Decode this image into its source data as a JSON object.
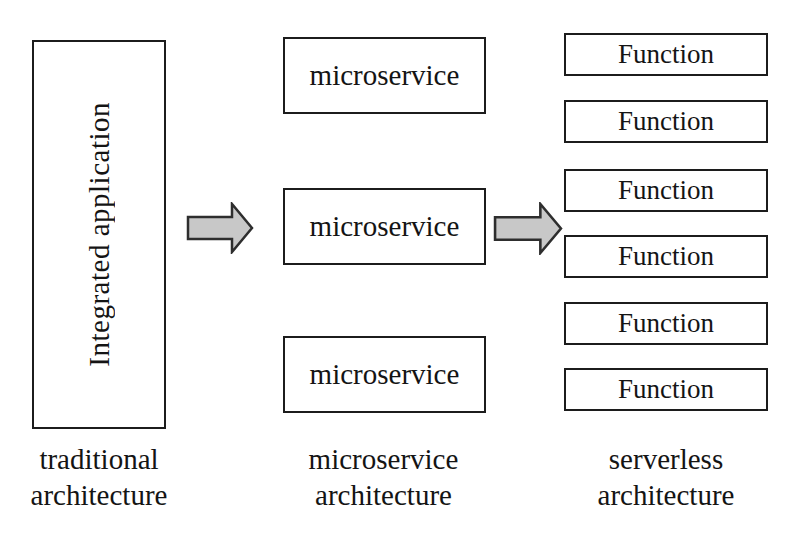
{
  "diagram": {
    "columns": [
      {
        "label_lines": [
          "traditional",
          "architecture"
        ],
        "boxes": [
          "Integrated application"
        ]
      },
      {
        "label_lines": [
          "microservice",
          "architecture"
        ],
        "boxes": [
          "microservice",
          "microservice",
          "microservice"
        ]
      },
      {
        "label_lines": [
          "serverless",
          "architecture"
        ],
        "boxes": [
          "Function",
          "Function",
          "Function",
          "Function",
          "Function",
          "Function"
        ]
      }
    ],
    "arrows": [
      {
        "name": "arrow-traditional-to-microservice",
        "direction": "right"
      },
      {
        "name": "arrow-microservice-to-serverless",
        "direction": "right"
      }
    ],
    "colors": {
      "background": "#ffffff",
      "box_fill": "#ffffff",
      "box_border": "#1c1c1c",
      "arrow_fill": "#c8c8c8",
      "arrow_stroke": "#2e2e2e",
      "text": "#141414"
    }
  }
}
